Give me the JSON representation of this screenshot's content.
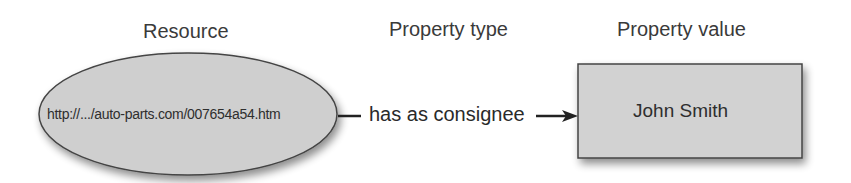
{
  "headers": {
    "resource": "Resource",
    "property_type": "Property type",
    "property_value": "Property value"
  },
  "resource_node": {
    "shape": "ellipse",
    "text": "http://.../auto-parts.com/007654a54.htm",
    "fill": "#cfcfcf",
    "stroke": "#444444"
  },
  "edge": {
    "label": "has as consignee",
    "direction": "resource-to-value"
  },
  "value_node": {
    "shape": "rectangle",
    "text": "John Smith",
    "fill": "#d2d2d2",
    "stroke": "#444444"
  }
}
